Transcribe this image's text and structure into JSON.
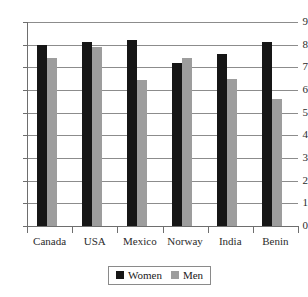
{
  "chart_data": {
    "type": "bar",
    "title": "",
    "subtitle": "",
    "xlabel": "",
    "ylabel": "",
    "categories": [
      "Canada",
      "USA",
      "Mexico",
      "Norway",
      "India",
      "Benin"
    ],
    "series": [
      {
        "name": "Women",
        "color": "#161616",
        "values": [
          8.0,
          8.1,
          8.2,
          7.2,
          7.6,
          8.1
        ]
      },
      {
        "name": "Men",
        "color": "#9d9d9d",
        "values": [
          7.4,
          7.9,
          6.45,
          7.4,
          6.5,
          5.6
        ]
      }
    ],
    "ylim": [
      0,
      9
    ],
    "yticks": [
      0,
      1,
      2,
      3,
      4,
      5,
      6,
      7,
      8,
      9
    ],
    "ytick_labels": [
      "0",
      "1",
      "2",
      "3",
      "4",
      "5",
      "6",
      "7",
      "8",
      "9"
    ],
    "grid": true,
    "grid_axis": "y",
    "legend": {
      "position": "bottom-center",
      "entries": [
        {
          "label": "Women",
          "color": "#161616",
          "swatch": "square-black-icon"
        },
        {
          "label": "Men",
          "color": "#9d9d9d",
          "swatch": "square-gray-icon"
        }
      ]
    },
    "annotations": []
  }
}
